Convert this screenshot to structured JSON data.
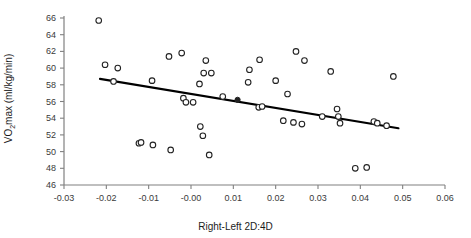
{
  "chart_data": {
    "type": "scatter",
    "title": "",
    "xlabel": "Right-Left 2D:4D",
    "ylabel": "VO2max (ml/kg/min)",
    "ylabel_parts": {
      "pre": "VO",
      "sub": "2",
      "post": "max (ml/kg/min)"
    },
    "xlim": [
      -0.03,
      0.06
    ],
    "ylim": [
      46,
      66
    ],
    "xticks": [
      -0.03,
      -0.02,
      -0.01,
      -0.0,
      0.01,
      0.02,
      0.03,
      0.04,
      0.05,
      0.06
    ],
    "xtick_labels": [
      "-0.03",
      "-0.02",
      "-0.01",
      "-0.00",
      "0.01",
      "0.02",
      "0.03",
      "0.04",
      "0.05",
      "0.06"
    ],
    "yticks": [
      46,
      48,
      50,
      52,
      54,
      56,
      58,
      60,
      62,
      64,
      66
    ],
    "ytick_labels": [
      "46",
      "48",
      "50",
      "52",
      "54",
      "56",
      "58",
      "60",
      "62",
      "64",
      "66"
    ],
    "grid": false,
    "legend": "none",
    "marker": {
      "style": "open-circle",
      "color": "#222222",
      "size": 4
    },
    "points": [
      {
        "x": -0.0218,
        "y": 65.7
      },
      {
        "x": -0.0203,
        "y": 60.4
      },
      {
        "x": -0.0173,
        "y": 60.0
      },
      {
        "x": -0.0183,
        "y": 58.4
      },
      {
        "x": -0.0123,
        "y": 51.0
      },
      {
        "x": -0.0118,
        "y": 51.1
      },
      {
        "x": -0.0092,
        "y": 58.5
      },
      {
        "x": -0.009,
        "y": 50.8
      },
      {
        "x": -0.0052,
        "y": 61.4
      },
      {
        "x": -0.0048,
        "y": 50.2
      },
      {
        "x": -0.0022,
        "y": 61.8
      },
      {
        "x": -0.0018,
        "y": 56.4
      },
      {
        "x": -0.0012,
        "y": 55.9
      },
      {
        "x": 0.0005,
        "y": 55.9
      },
      {
        "x": 0.0022,
        "y": 53.0
      },
      {
        "x": 0.0035,
        "y": 60.9
      },
      {
        "x": 0.003,
        "y": 59.4
      },
      {
        "x": 0.0028,
        "y": 51.9
      },
      {
        "x": 0.002,
        "y": 58.1
      },
      {
        "x": 0.0048,
        "y": 59.4
      },
      {
        "x": 0.0043,
        "y": 49.6
      },
      {
        "x": 0.0075,
        "y": 56.6
      },
      {
        "x": 0.011,
        "y": 56.2,
        "filled": true
      },
      {
        "x": 0.0138,
        "y": 59.8
      },
      {
        "x": 0.0135,
        "y": 58.3
      },
      {
        "x": 0.016,
        "y": 55.3
      },
      {
        "x": 0.0168,
        "y": 55.4
      },
      {
        "x": 0.0162,
        "y": 61.0
      },
      {
        "x": 0.02,
        "y": 58.5
      },
      {
        "x": 0.0228,
        "y": 56.9
      },
      {
        "x": 0.0248,
        "y": 62.0
      },
      {
        "x": 0.0268,
        "y": 60.9
      },
      {
        "x": 0.0218,
        "y": 53.7
      },
      {
        "x": 0.0242,
        "y": 53.5
      },
      {
        "x": 0.0262,
        "y": 53.3
      },
      {
        "x": 0.031,
        "y": 54.2
      },
      {
        "x": 0.0345,
        "y": 55.1
      },
      {
        "x": 0.0348,
        "y": 54.2
      },
      {
        "x": 0.0352,
        "y": 53.4
      },
      {
        "x": 0.033,
        "y": 59.6
      },
      {
        "x": 0.0388,
        "y": 48.0
      },
      {
        "x": 0.0415,
        "y": 48.1
      },
      {
        "x": 0.0432,
        "y": 53.6
      },
      {
        "x": 0.044,
        "y": 53.4
      },
      {
        "x": 0.0462,
        "y": 53.1
      },
      {
        "x": 0.0478,
        "y": 59.0
      }
    ],
    "trendline": {
      "label": "linear-fit",
      "x_start": -0.0215,
      "y_start": 58.7,
      "x_end": 0.049,
      "y_end": 52.8,
      "color": "#000000",
      "width": 2.2
    }
  },
  "axes": {
    "spine_color": "#808080",
    "tick_color": "#808080"
  }
}
